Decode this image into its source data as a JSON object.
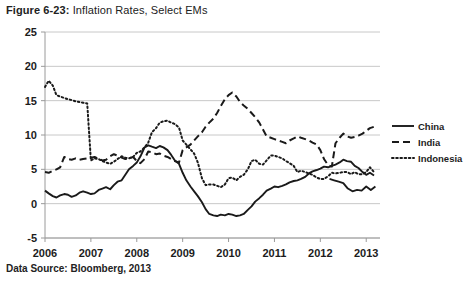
{
  "figure": {
    "number": "Figure 6-23:",
    "caption": " Inflation Rates, Select EMs"
  },
  "source": {
    "text": "Data Source: Bloomberg, 2013"
  },
  "colors": {
    "series_line": "#1a1a1a",
    "gridline": "#c8c8c8",
    "axis": "#9a9a9a",
    "background": "#ffffff",
    "text": "#1c1c1c"
  },
  "chart_data": {
    "type": "line",
    "title": "Inflation Rates, Select EMs",
    "xlabel": "",
    "ylabel": "",
    "xlim": [
      2006.0,
      2013.3
    ],
    "ylim": [
      -5,
      25
    ],
    "ytick_values": [
      -5,
      0,
      5,
      10,
      15,
      20,
      25
    ],
    "ytick_labels": [
      "-5",
      "0",
      "5",
      "10",
      "15",
      "20",
      "25"
    ],
    "xtick_values": [
      2006,
      2007,
      2008,
      2009,
      2010,
      2011,
      2012,
      2013
    ],
    "xtick_labels": [
      "2006",
      "2007",
      "2008",
      "2009",
      "2010",
      "2011",
      "2012",
      "2013"
    ],
    "grid": "horizontal",
    "legend_position": "right",
    "series": [
      {
        "name": "China",
        "style": "solid",
        "x": [
          2006.0,
          2006.08,
          2006.17,
          2006.25,
          2006.33,
          2006.42,
          2006.5,
          2006.58,
          2006.67,
          2006.75,
          2006.83,
          2006.92,
          2007.0,
          2007.08,
          2007.17,
          2007.25,
          2007.33,
          2007.42,
          2007.5,
          2007.58,
          2007.67,
          2007.75,
          2007.83,
          2007.92,
          2008.0,
          2008.08,
          2008.17,
          2008.25,
          2008.33,
          2008.42,
          2008.5,
          2008.58,
          2008.67,
          2008.75,
          2008.83,
          2008.92,
          2009.0,
          2009.08,
          2009.17,
          2009.25,
          2009.33,
          2009.42,
          2009.5,
          2009.58,
          2009.67,
          2009.75,
          2009.83,
          2009.92,
          2010.0,
          2010.08,
          2010.17,
          2010.25,
          2010.33,
          2010.42,
          2010.5,
          2010.58,
          2010.67,
          2010.75,
          2010.83,
          2010.92,
          2011.0,
          2011.08,
          2011.17,
          2011.25,
          2011.33,
          2011.42,
          2011.5,
          2011.58,
          2011.67,
          2011.75,
          2011.83,
          2011.92,
          2012.0,
          2012.08,
          2012.17,
          2012.25,
          2012.33,
          2012.42,
          2012.5,
          2012.58,
          2012.67,
          2012.75,
          2012.83,
          2012.92,
          2013.0,
          2013.08,
          2013.17
        ],
        "values": [
          1.9,
          1.5,
          1.1,
          0.9,
          1.2,
          1.4,
          1.3,
          1.0,
          1.2,
          1.6,
          1.8,
          1.6,
          1.4,
          1.5,
          2.0,
          2.2,
          2.4,
          2.1,
          2.7,
          3.2,
          3.4,
          4.2,
          5.0,
          5.5,
          6.0,
          6.9,
          8.2,
          8.5,
          8.3,
          8.1,
          8.4,
          8.2,
          7.8,
          7.1,
          6.3,
          5.8,
          4.5,
          3.4,
          2.5,
          1.8,
          1.1,
          0.2,
          -0.8,
          -1.5,
          -1.7,
          -1.8,
          -1.6,
          -1.7,
          -1.5,
          -1.6,
          -1.8,
          -1.7,
          -1.5,
          -0.9,
          -0.4,
          0.3,
          0.8,
          1.3,
          1.9,
          2.2,
          2.5,
          2.4,
          2.6,
          2.8,
          3.1,
          3.3,
          3.4,
          3.6,
          3.9,
          4.4,
          4.7,
          4.9,
          5.1,
          5.4,
          5.3,
          5.5,
          5.7,
          6.0,
          6.4,
          6.2,
          6.1,
          5.5,
          5.2,
          4.6,
          4.2,
          4.5,
          4.1
        ],
        "extra_x": [
          2012.2,
          2012.3,
          2012.4,
          2012.5,
          2012.6,
          2012.7,
          2012.8,
          2012.9,
          2013.0,
          2013.1,
          2013.2
        ],
        "extra_values": [
          3.6,
          3.4,
          3.2,
          3.0,
          2.2,
          1.8,
          2.0,
          1.9,
          2.5,
          2.0,
          2.5
        ]
      },
      {
        "name": "India",
        "style": "dashed",
        "x": [
          2006.0,
          2006.08,
          2006.17,
          2006.25,
          2006.33,
          2006.42,
          2006.5,
          2006.58,
          2006.67,
          2006.75,
          2006.83,
          2006.92,
          2007.0,
          2007.08,
          2007.17,
          2007.25,
          2007.33,
          2007.42,
          2007.5,
          2007.58,
          2007.67,
          2007.75,
          2007.83,
          2007.92,
          2008.0,
          2008.08,
          2008.17,
          2008.25,
          2008.33,
          2008.42,
          2008.5,
          2008.58,
          2008.67,
          2008.75,
          2008.83,
          2008.92,
          2009.0,
          2009.08,
          2009.17,
          2009.25,
          2009.33,
          2009.42,
          2009.5,
          2009.58,
          2009.67,
          2009.75,
          2009.83,
          2009.92,
          2010.0,
          2010.08,
          2010.17,
          2010.25,
          2010.33,
          2010.42,
          2010.5,
          2010.58,
          2010.67,
          2010.75,
          2010.83,
          2010.92,
          2011.0,
          2011.08,
          2011.17,
          2011.25,
          2011.33,
          2011.42,
          2011.5,
          2011.58,
          2011.67,
          2011.75,
          2011.83,
          2011.92,
          2012.0,
          2012.08,
          2012.17,
          2012.25,
          2012.33,
          2012.42,
          2012.5,
          2012.58,
          2012.67,
          2012.75,
          2012.83,
          2012.92,
          2013.0,
          2013.08,
          2013.17
        ],
        "values": [
          4.6,
          4.5,
          4.8,
          5.0,
          5.3,
          6.8,
          6.5,
          6.4,
          6.6,
          6.4,
          6.5,
          6.6,
          6.7,
          6.8,
          6.5,
          6.3,
          6.4,
          6.9,
          7.2,
          7.0,
          6.7,
          6.5,
          6.6,
          6.8,
          6.2,
          5.9,
          6.5,
          7.6,
          7.5,
          7.2,
          7.3,
          7.0,
          6.8,
          6.5,
          6.2,
          6.0,
          7.8,
          8.2,
          8.6,
          9.2,
          9.8,
          10.4,
          11.2,
          11.8,
          12.4,
          13.2,
          14.2,
          15.2,
          15.8,
          16.2,
          15.6,
          14.8,
          14.3,
          13.8,
          13.2,
          12.6,
          11.8,
          10.8,
          9.8,
          9.6,
          9.4,
          9.2,
          9.0,
          8.8,
          9.2,
          9.5,
          9.8,
          9.6,
          9.4,
          9.2,
          8.9,
          8.6,
          7.8,
          6.5,
          5.6,
          5.4,
          8.8,
          9.6,
          10.2,
          9.8,
          9.6,
          9.7,
          9.9,
          10.2,
          10.6,
          11.0,
          11.2
        ]
      },
      {
        "name": "Indonesia",
        "style": "dotted",
        "x": [
          2006.0,
          2006.08,
          2006.17,
          2006.25,
          2006.33,
          2006.42,
          2006.5,
          2006.58,
          2006.67,
          2006.75,
          2006.83,
          2006.92,
          2007.0,
          2007.08,
          2007.17,
          2007.25,
          2007.33,
          2007.42,
          2007.5,
          2007.58,
          2007.67,
          2007.75,
          2007.83,
          2007.92,
          2008.0,
          2008.08,
          2008.17,
          2008.25,
          2008.33,
          2008.42,
          2008.5,
          2008.58,
          2008.67,
          2008.75,
          2008.83,
          2008.92,
          2009.0,
          2009.08,
          2009.17,
          2009.25,
          2009.33,
          2009.42,
          2009.5,
          2009.58,
          2009.67,
          2009.75,
          2009.83,
          2009.92,
          2010.0,
          2010.08,
          2010.17,
          2010.25,
          2010.33,
          2010.42,
          2010.5,
          2010.58,
          2010.67,
          2010.75,
          2010.83,
          2010.92,
          2011.0,
          2011.08,
          2011.17,
          2011.25,
          2011.33,
          2011.42,
          2011.5,
          2011.58,
          2011.67,
          2011.75,
          2011.83,
          2011.92,
          2012.0,
          2012.08,
          2012.17,
          2012.25,
          2012.33,
          2012.42,
          2012.5,
          2012.58,
          2012.67,
          2012.75,
          2012.83,
          2012.92,
          2013.0,
          2013.08,
          2013.17
        ],
        "values": [
          17.0,
          17.9,
          17.2,
          15.8,
          15.6,
          15.4,
          15.2,
          15.1,
          14.9,
          14.8,
          14.7,
          14.6,
          6.3,
          6.6,
          6.5,
          6.2,
          6.0,
          5.8,
          6.1,
          6.5,
          6.9,
          6.7,
          6.6,
          6.8,
          7.4,
          7.6,
          8.2,
          8.9,
          10.4,
          11.0,
          11.8,
          12.0,
          12.1,
          11.8,
          11.6,
          11.1,
          9.2,
          8.6,
          7.9,
          7.3,
          6.0,
          3.7,
          2.7,
          2.8,
          2.8,
          2.6,
          2.4,
          2.8,
          3.7,
          3.8,
          3.4,
          3.9,
          4.2,
          5.0,
          6.2,
          6.4,
          5.8,
          5.7,
          6.3,
          7.0,
          7.0,
          6.8,
          6.6,
          6.2,
          5.9,
          5.5,
          4.6,
          4.8,
          4.6,
          4.4,
          4.2,
          3.8,
          3.6,
          3.6,
          4.0,
          4.5,
          4.4,
          4.5,
          4.6,
          4.6,
          4.3,
          4.6,
          4.3,
          4.3,
          4.6,
          5.3,
          4.6
        ]
      }
    ]
  },
  "legend": {
    "items": [
      {
        "label": "China",
        "style": "solid"
      },
      {
        "label": "India",
        "style": "dashed"
      },
      {
        "label": "Indonesia",
        "style": "dotted"
      }
    ]
  }
}
